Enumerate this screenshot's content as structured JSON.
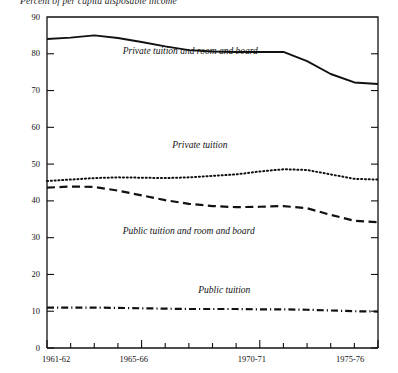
{
  "chart_data": {
    "type": "line",
    "title": "Percent of per capita disposable income",
    "xlabel": "",
    "ylabel": "",
    "ylim": [
      0,
      90
    ],
    "ytick_values": [
      0,
      10,
      20,
      30,
      40,
      50,
      60,
      70,
      80,
      90
    ],
    "ytick_labels": [
      "0",
      "10",
      "20",
      "30",
      "40",
      "50",
      "60",
      "70",
      "80",
      "90"
    ],
    "x": [
      "1961-62",
      "1962-63",
      "1963-64",
      "1964-65",
      "1965-66",
      "1966-67",
      "1967-68",
      "1968-69",
      "1969-70",
      "1970-71",
      "1971-72",
      "1972-73",
      "1973-74",
      "1974-75",
      "1975-76"
    ],
    "xtick_labels": [
      "1961-62",
      "1965-66",
      "1970-71",
      "1975-76"
    ],
    "xtick_label_positions": [
      0,
      4,
      9,
      14
    ],
    "grid": false,
    "legend": "inline-annotations",
    "series": [
      {
        "name": "Private tuition and room and board",
        "style": "solid",
        "label_x_index": 3.2,
        "label_y": 80.5,
        "values": [
          84.0,
          84.4,
          85.0,
          84.3,
          83.2,
          82.0,
          81.0,
          80.6,
          80.5,
          80.5,
          80.5,
          78.0,
          74.5,
          72.2,
          71.8
        ]
      },
      {
        "name": "Private tuition",
        "style": "dotted",
        "label_x_index": 5.3,
        "label_y": 55.0,
        "values": [
          45.4,
          45.8,
          46.2,
          46.4,
          46.3,
          46.2,
          46.4,
          46.8,
          47.2,
          48.0,
          48.6,
          48.4,
          47.2,
          46.0,
          45.8
        ]
      },
      {
        "name": "Public tuition and room and board",
        "style": "dashed",
        "label_x_index": 3.2,
        "label_y": 31.5,
        "values": [
          43.6,
          43.9,
          43.8,
          42.8,
          41.5,
          40.2,
          39.2,
          38.6,
          38.3,
          38.4,
          38.6,
          38.0,
          36.2,
          34.6,
          34.2
        ]
      },
      {
        "name": "Public tuition",
        "style": "dashdot",
        "label_x_index": 6.4,
        "label_y": 15.5,
        "values": [
          11.0,
          11.0,
          11.0,
          10.9,
          10.8,
          10.7,
          10.6,
          10.6,
          10.6,
          10.5,
          10.5,
          10.4,
          10.2,
          10.0,
          9.9
        ]
      }
    ]
  },
  "plot": {
    "left": 47,
    "right": 378,
    "top": 17,
    "bottom": 348
  }
}
